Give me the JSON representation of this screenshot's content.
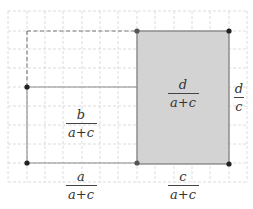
{
  "diagram": {
    "type": "area-model",
    "colors": {
      "grid": "#d9d9d9",
      "shade": "#d4d4d4",
      "outline": "#777777",
      "point": "#222222"
    },
    "labels": {
      "left_region": {
        "numerator": "b",
        "denominator": "a+c"
      },
      "shaded_region": {
        "numerator": "d",
        "denominator": "a+c"
      },
      "right_side": {
        "numerator": "d",
        "denominator": "c"
      },
      "bottom_left": {
        "numerator": "a",
        "denominator": "a+c"
      },
      "bottom_right": {
        "numerator": "c",
        "denominator": "a+c"
      }
    }
  }
}
